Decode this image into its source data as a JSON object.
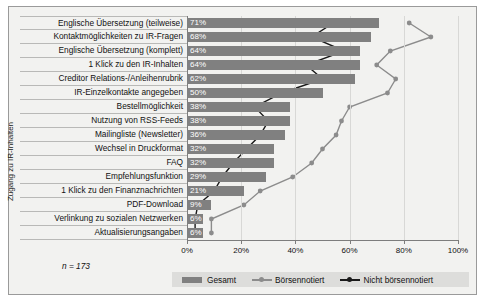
{
  "chart_data": {
    "type": "bar",
    "title": "",
    "subtitle": "",
    "xlabel": "",
    "ylabel": "Zugang zu IR-Inhalten",
    "xlim": [
      0,
      100
    ],
    "xtick_labels": [
      "0%",
      "20%",
      "40%",
      "60%",
      "80%",
      "100%"
    ],
    "xticks": [
      0,
      20,
      40,
      60,
      80,
      100
    ],
    "grid": true,
    "legend_position": "bottom",
    "annotation": "n = 173",
    "categories": [
      "Englische Übersetzung (teilweise)",
      "Kontaktmöglichkeiten zu IR-Fragen",
      "Englische Übersetzung (komplett)",
      "1 Klick zu den IR-Inhalten",
      "Creditor Relations-/Anleihenrubrik",
      "IR-Einzelkontakte angegeben",
      "Bestellmöglichkeit",
      "Nutzung von RSS-Feeds",
      "Mailingliste (Newsletter)",
      "Wechsel in Druckformat",
      "FAQ",
      "Empfehlungsfunktion",
      "1 Klick zu den Finanznachrichten",
      "PDF-Download",
      "Verlinkung zu sozialen Netzwerken",
      "Aktualisierungsangaben"
    ],
    "value_labels": [
      "71%",
      "68%",
      "64%",
      "64%",
      "62%",
      "50%",
      "38%",
      "38%",
      "36%",
      "32%",
      "32%",
      "29%",
      "21%",
      "9%",
      "6%",
      "6%"
    ],
    "series": [
      {
        "name": "Gesamt",
        "type": "bar",
        "color": "#808080",
        "values": [
          71,
          68,
          64,
          64,
          62,
          50,
          38,
          38,
          36,
          32,
          32,
          29,
          21,
          9,
          6,
          6
        ]
      },
      {
        "name": "Börsennotiert",
        "type": "line",
        "color": "#8c8c8c",
        "values": [
          82,
          90,
          75,
          70,
          77,
          74,
          60,
          57,
          55,
          50,
          46,
          39,
          27,
          21,
          9,
          9
        ]
      },
      {
        "name": "Nicht börsennotiert",
        "type": "line",
        "color": "#1a1a1a",
        "values": [
          54,
          46,
          58,
          44,
          50,
          35,
          25,
          30,
          27,
          22,
          17,
          13,
          10,
          4,
          3,
          3
        ]
      }
    ]
  },
  "legend": {
    "items": [
      {
        "label": "Gesamt",
        "marker": "bar-swatch",
        "color": "#808080"
      },
      {
        "label": "Börsennotiert",
        "marker": "line-marker",
        "color": "#8c8c8c"
      },
      {
        "label": "Nicht börsennotiert",
        "marker": "line-marker",
        "color": "#1a1a1a"
      }
    ]
  }
}
